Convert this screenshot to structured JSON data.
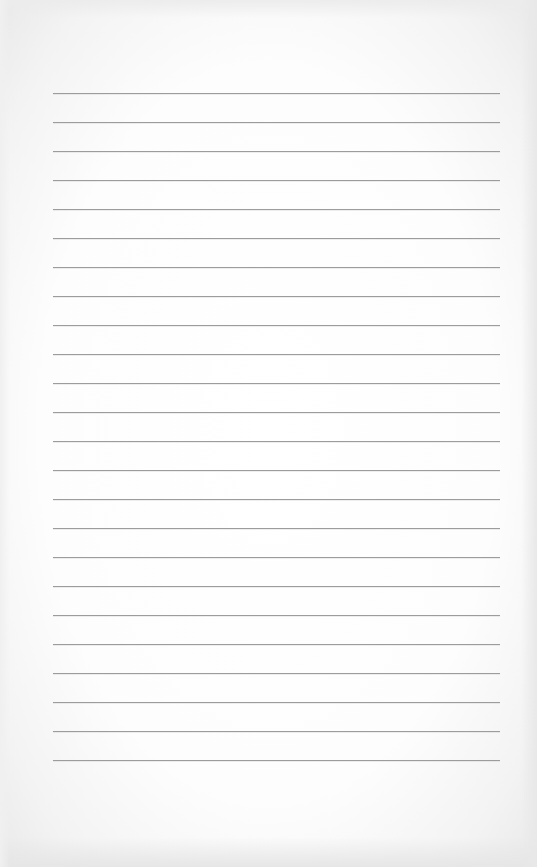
{
  "page": {
    "type": "lined-paper",
    "background_color": "#fdfdfd",
    "line_color": "#9c9c9c",
    "line_left": 53,
    "line_width": 447,
    "line_spacing": 29,
    "line_count": 24,
    "first_line_y": 93,
    "lines": [
      93,
      122,
      151,
      180,
      209,
      238,
      267,
      296,
      325,
      354,
      383,
      412,
      441,
      470,
      499,
      528,
      557,
      586,
      615,
      644,
      673,
      702,
      731,
      760
    ]
  }
}
